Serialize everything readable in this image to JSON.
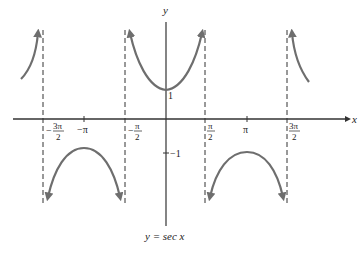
{
  "figure": {
    "caption": "y = sec x",
    "axis_labels": {
      "x": "x",
      "y": "y"
    },
    "x_ticks": [
      {
        "label_num": "3π",
        "label_den": "2",
        "sign": "−",
        "value": "-3π/2"
      },
      {
        "label": "−π",
        "value": "-π"
      },
      {
        "label_num": "π",
        "label_den": "2",
        "sign": "−",
        "value": "-π/2"
      },
      {
        "label_num": "π",
        "label_den": "2",
        "sign": "",
        "value": "π/2"
      },
      {
        "label": "π",
        "value": "π"
      },
      {
        "label_num": "3π",
        "label_den": "2",
        "sign": "",
        "value": "3π/2"
      }
    ],
    "y_ticks": [
      {
        "label": "1",
        "value": 1
      },
      {
        "label": "−1",
        "value": -1
      }
    ],
    "asymptotes": [
      "-3π/2",
      "-π/2",
      "π/2",
      "3π/2"
    ],
    "colors": {
      "curve": "#6e6e6e",
      "axis": "#333333",
      "asymptote": "#333333"
    }
  }
}
